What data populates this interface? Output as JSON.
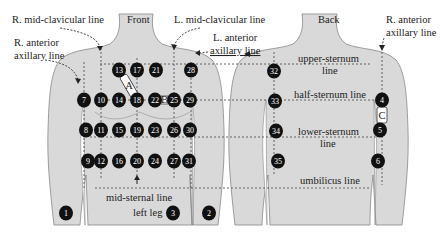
{
  "views": {
    "front": "Front",
    "back": "Back"
  },
  "labels": {
    "r_mid_clavicular": "R. mid-clavicular line",
    "l_mid_clavicular": "L. mid-clavicular line",
    "r_anterior_axillary_front_1": "R. anterior",
    "r_anterior_axillary_front_2": "axillary line",
    "l_anterior_axillary_1": "L. anterior",
    "l_anterior_axillary_2": "axillary line",
    "r_anterior_axillary_back_1": "R. anterior",
    "r_anterior_axillary_back_2": "axillary line",
    "upper_sternum_1": "upper-sternum",
    "upper_sternum_2": "line",
    "half_sternum": "half-sternum line",
    "lower_sternum_1": "lower-sternum",
    "lower_sternum_2": "line",
    "umbilicus": "umbilicus line",
    "mid_sternal": "mid-sternal line",
    "left_leg": "left leg"
  },
  "patches": {
    "A": "A",
    "B": "B",
    "C": "C"
  },
  "electrodes_front": [
    {
      "id": "13",
      "x": 119,
      "y": 70
    },
    {
      "id": "17",
      "x": 137,
      "y": 70
    },
    {
      "id": "21",
      "x": 156,
      "y": 70
    },
    {
      "id": "28",
      "x": 191,
      "y": 70
    },
    {
      "id": "7",
      "x": 84,
      "y": 100
    },
    {
      "id": "10",
      "x": 101,
      "y": 100
    },
    {
      "id": "14",
      "x": 119,
      "y": 100
    },
    {
      "id": "18",
      "x": 137,
      "y": 100
    },
    {
      "id": "22",
      "x": 155,
      "y": 100
    },
    {
      "id": "25",
      "x": 174,
      "y": 100
    },
    {
      "id": "29",
      "x": 190,
      "y": 100
    },
    {
      "id": "8",
      "x": 86,
      "y": 130
    },
    {
      "id": "11",
      "x": 101,
      "y": 130
    },
    {
      "id": "15",
      "x": 119,
      "y": 130
    },
    {
      "id": "19",
      "x": 137,
      "y": 130
    },
    {
      "id": "23",
      "x": 155,
      "y": 130
    },
    {
      "id": "26",
      "x": 174,
      "y": 130
    },
    {
      "id": "30",
      "x": 190,
      "y": 130
    },
    {
      "id": "9",
      "x": 88,
      "y": 161
    },
    {
      "id": "12",
      "x": 101,
      "y": 161
    },
    {
      "id": "16",
      "x": 119,
      "y": 161
    },
    {
      "id": "20",
      "x": 137,
      "y": 161
    },
    {
      "id": "24",
      "x": 155,
      "y": 161
    },
    {
      "id": "27",
      "x": 174,
      "y": 161
    },
    {
      "id": "31",
      "x": 189,
      "y": 161
    },
    {
      "id": "1",
      "x": 66,
      "y": 213
    },
    {
      "id": "3",
      "x": 173,
      "y": 213
    },
    {
      "id": "2",
      "x": 209,
      "y": 213
    }
  ],
  "electrodes_back": [
    {
      "id": "32",
      "x": 274,
      "y": 71
    },
    {
      "id": "33",
      "x": 275,
      "y": 101
    },
    {
      "id": "34",
      "x": 276,
      "y": 131
    },
    {
      "id": "35",
      "x": 278,
      "y": 161
    },
    {
      "id": "4",
      "x": 382,
      "y": 100
    },
    {
      "id": "5",
      "x": 380,
      "y": 130
    },
    {
      "id": "6",
      "x": 378,
      "y": 161
    }
  ]
}
